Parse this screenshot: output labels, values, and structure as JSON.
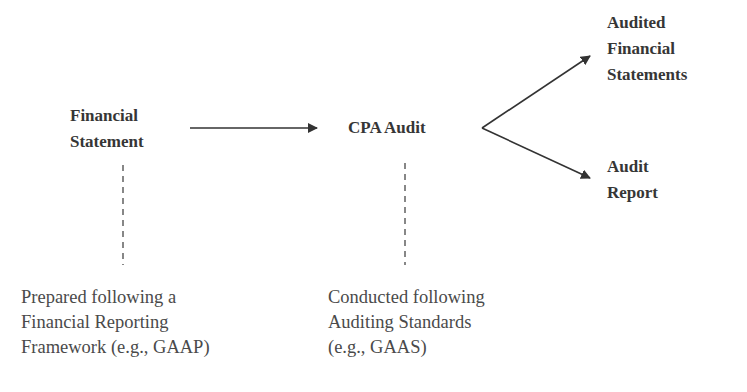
{
  "diagram": {
    "nodes": {
      "financial_statement": {
        "lines": [
          "Financial",
          "Statement"
        ]
      },
      "cpa_audit": {
        "lines": [
          "CPA Audit"
        ]
      },
      "audited_financial_statements": {
        "lines": [
          "Audited",
          "Financial",
          "Statements"
        ]
      },
      "audit_report": {
        "lines": [
          "Audit",
          "Report"
        ]
      }
    },
    "notes": {
      "framework": {
        "lines": [
          "Prepared following a",
          "Financial Reporting",
          "Framework (e.g., GAAP)"
        ]
      },
      "standards": {
        "lines": [
          "Conducted following",
          "Auditing Standards",
          "(e.g., GAAS)"
        ]
      }
    },
    "edges": [
      {
        "from": "financial_statement",
        "to": "cpa_audit",
        "style": "solid-arrow"
      },
      {
        "from": "cpa_audit",
        "to": "audited_financial_statements",
        "style": "solid-arrow"
      },
      {
        "from": "cpa_audit",
        "to": "audit_report",
        "style": "solid-arrow"
      },
      {
        "from": "financial_statement",
        "to": "framework",
        "style": "dashed"
      },
      {
        "from": "cpa_audit",
        "to": "standards",
        "style": "dashed"
      }
    ],
    "colors": {
      "text": "#363636",
      "line": "#333333",
      "note_text": "#4a4a4a"
    }
  }
}
